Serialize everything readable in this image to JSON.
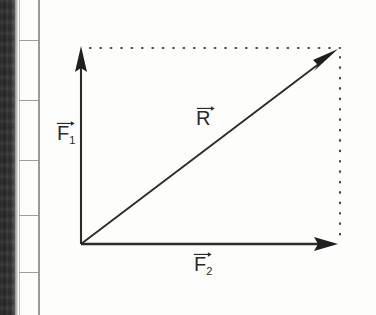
{
  "figure": {
    "kind": "vector-addition-diagram",
    "title_text": "",
    "ink_color": "#2b2b2b",
    "paper_color": "#fdfdfc",
    "gutter_color": "#2f2f2f",
    "rule_color": "#9a9a9a",
    "origin": {
      "x": 81,
      "y": 244
    },
    "vectors": [
      {
        "id": "f1",
        "label_letter": "F",
        "label_subscript": "1",
        "label_overarrow": "right-arrow-overline",
        "from": {
          "x": 81,
          "y": 244
        },
        "to": {
          "x": 81,
          "y": 48
        },
        "length_px": 196,
        "direction": "up",
        "label_pos": {
          "x": 57,
          "y": 124
        }
      },
      {
        "id": "f2",
        "label_letter": "F",
        "label_subscript": "2",
        "label_overarrow": "right-arrow-overline",
        "from": {
          "x": 81,
          "y": 244
        },
        "to": {
          "x": 337,
          "y": 244
        },
        "length_px": 256,
        "direction": "right",
        "label_pos": {
          "x": 194,
          "y": 253
        }
      },
      {
        "id": "r",
        "label_letter": "R",
        "label_subscript": "",
        "label_overarrow": "right-arrow-overline",
        "from": {
          "x": 81,
          "y": 244
        },
        "to": {
          "x": 337,
          "y": 50
        },
        "length_px": 321,
        "direction": "diagonal-up-right",
        "label_pos": {
          "x": 194,
          "y": 108
        }
      }
    ],
    "construction_lines": [
      {
        "id": "top-dotted",
        "style": "dotted",
        "from": {
          "x": 88,
          "y": 48
        },
        "to": {
          "x": 340,
          "y": 48
        },
        "orientation": "horizontal",
        "dot_spacing_px": 10
      },
      {
        "id": "right-dotted",
        "style": "dotted",
        "from": {
          "x": 340,
          "y": 56
        },
        "to": {
          "x": 340,
          "y": 240
        },
        "orientation": "vertical",
        "dot_spacing_px": 10
      }
    ],
    "margin_rules": {
      "vertical_line_x": [
        38,
        19
      ],
      "horizontal_line_y": [
        40,
        100,
        160,
        215,
        272
      ]
    }
  }
}
